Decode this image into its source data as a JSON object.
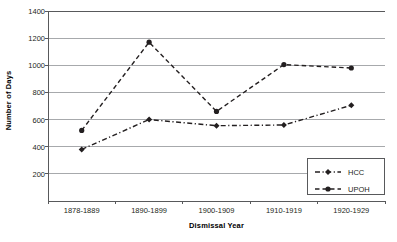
{
  "chart_data": {
    "type": "line",
    "title": "",
    "xlabel": "Dismissal Year",
    "ylabel": "Number of Days",
    "categories": [
      "1878-1889",
      "1890-1899",
      "1900-1909",
      "1910-1919",
      "1920-1929"
    ],
    "series": [
      {
        "name": "HCC",
        "marker": "diamond",
        "dash": "dash-dot",
        "color": "#231f20",
        "values": [
          380,
          600,
          555,
          560,
          705
        ]
      },
      {
        "name": "UPOH",
        "marker": "circle",
        "dash": "dashed",
        "color": "#231f20",
        "values": [
          520,
          1170,
          660,
          1005,
          980
        ]
      }
    ],
    "ylim": [
      0,
      1400
    ],
    "yticks": [
      200,
      400,
      600,
      800,
      1000,
      1200,
      1400
    ],
    "ytick_labels": [
      "200",
      "400",
      "600",
      "800",
      "1000",
      "1200",
      "1400"
    ],
    "grid": true,
    "grid_axis": "y",
    "legend_position": "lower-right",
    "legend_entries": [
      "HCC",
      "UPOH"
    ],
    "axis_color": "#58595b",
    "grid_color": "#a7a9ac",
    "background": "#ffffff"
  }
}
